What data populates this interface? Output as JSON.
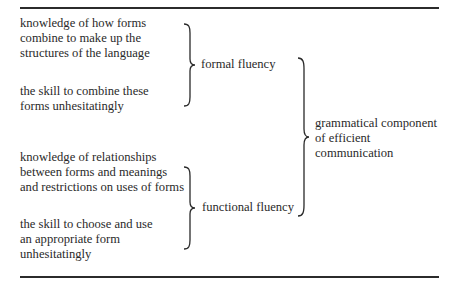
{
  "diagram": {
    "type": "bracket-hierarchy",
    "left_items": [
      {
        "group": "formal",
        "lines": [
          "knowledge of how forms",
          "combine to make up the",
          "structures of the language"
        ]
      },
      {
        "group": "formal",
        "lines": [
          "the skill to combine these",
          "forms unhesitatingly"
        ]
      },
      {
        "group": "functional",
        "lines": [
          "knowledge of relationships",
          "between forms and meanings",
          "and restrictions on uses of forms"
        ]
      },
      {
        "group": "functional",
        "lines": [
          "the skill to choose and use",
          "an appropriate form",
          "unhesitatingly"
        ]
      }
    ],
    "middle_items": [
      {
        "label": "formal fluency"
      },
      {
        "label": "functional fluency"
      }
    ],
    "right_item": {
      "lines": [
        "grammatical component",
        "of efficient",
        "communication"
      ]
    }
  }
}
